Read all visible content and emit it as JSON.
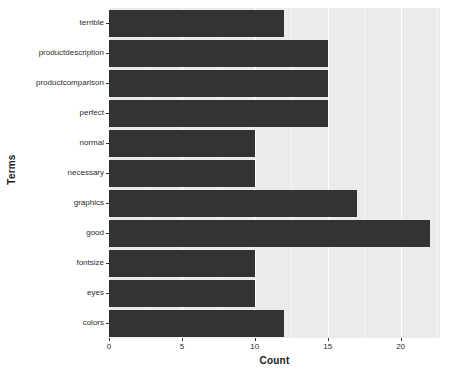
{
  "chart_data": {
    "type": "bar",
    "orientation": "horizontal",
    "title": "",
    "xlabel": "Count",
    "ylabel": "Terms",
    "categories": [
      "terrible",
      "productdescription",
      "productcomparison",
      "perfect",
      "normal",
      "necessary",
      "graphics",
      "good",
      "fontsize",
      "eyes",
      "colors"
    ],
    "values": [
      12,
      15,
      15,
      15,
      10,
      10,
      17,
      22,
      10,
      10,
      12
    ],
    "xlim": [
      0,
      22.7
    ],
    "xticks": [
      0,
      5,
      10,
      15,
      20
    ],
    "xtick_labels": [
      "0",
      "5",
      "10",
      "15",
      "20"
    ],
    "grid": true,
    "grid_color": "#ffffff",
    "minor_grid_color": "#f7f7f7",
    "panel_background": "#ebebeb",
    "bar_color": "#333333",
    "legend": null,
    "legend_position": "none"
  },
  "axes": {
    "y_title": "Terms",
    "x_title": "Count"
  }
}
